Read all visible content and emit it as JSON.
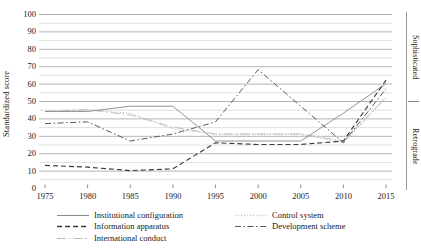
{
  "chart_data": {
    "type": "line",
    "title": "",
    "xlabel": "",
    "ylabel": "Standardized score",
    "xlim": [
      1973,
      2017
    ],
    "ylim": [
      0,
      100
    ],
    "grid": true,
    "grid_major_step": 10,
    "grid_minor_step": 5,
    "legend_position": "bottom",
    "x": [
      1975,
      1980,
      1985,
      1990,
      1995,
      2000,
      2005,
      2010,
      2015
    ],
    "xtick_labels": [
      "1975",
      "1980",
      "1985",
      "1990",
      "1995",
      "2000",
      "2005",
      "2010",
      "2015"
    ],
    "ytick_labels": [
      "100",
      "90",
      "80",
      "70",
      "60",
      "50",
      "40",
      "30",
      "20",
      "10",
      "0"
    ],
    "ytick_values": [
      100,
      90,
      80,
      70,
      60,
      50,
      40,
      30,
      20,
      10,
      0
    ],
    "right_axis_labels": {
      "top": "Sophisticated",
      "bottom": "Retrograde"
    },
    "series": [
      {
        "name": "Institutional configuration",
        "style": "solid",
        "color": "#8c8c8c",
        "values": [
          44,
          44,
          47,
          47,
          27,
          27,
          27,
          43,
          60
        ]
      },
      {
        "name": "Information apparatus",
        "style": "dashed",
        "color": "#3a3a3a",
        "values": [
          13,
          12,
          10,
          11,
          26,
          25,
          25,
          27,
          62
        ]
      },
      {
        "name": "International conduct",
        "style": "long-dash-dot",
        "color": "#bcbcbc",
        "values": [
          44,
          45,
          42,
          35,
          31,
          31,
          31,
          27,
          52
        ]
      },
      {
        "name": "Control system",
        "style": "dotted",
        "color": "#c9c9c9",
        "values": [
          44,
          45,
          43,
          34,
          31,
          31,
          31,
          26,
          52
        ]
      },
      {
        "name": "Development scheme",
        "style": "dash-dot",
        "color": "#5a5a5a",
        "values": [
          37,
          38,
          27,
          31,
          38,
          68,
          47,
          26,
          57
        ]
      }
    ]
  },
  "legend": {
    "column_1": [
      "Institutional configuration",
      "Information apparatus",
      "International conduct"
    ],
    "column_2": [
      "Control system",
      "Development scheme"
    ]
  }
}
